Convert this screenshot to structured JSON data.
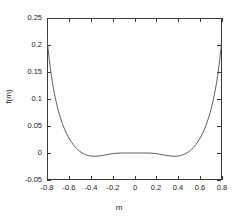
{
  "chart_data": {
    "type": "line",
    "title": "",
    "xlabel": "m",
    "ylabel": "f(m)",
    "xlim": [
      -0.8,
      0.8
    ],
    "ylim": [
      -0.05,
      0.25
    ],
    "grid": false,
    "legend": null,
    "xticks": [
      "-0.8",
      "-0.6",
      "-0.4",
      "-0.2",
      "0",
      "0.2",
      "0.4",
      "0.6",
      "0.8"
    ],
    "xtick_values": [
      -0.8,
      -0.6,
      -0.4,
      -0.2,
      0,
      0.2,
      0.4,
      0.6,
      0.8
    ],
    "yticks": [
      "-0.05",
      "0",
      "0.05",
      "0.1",
      "0.15",
      "0.2",
      "0.25"
    ],
    "ytick_values": [
      -0.05,
      0,
      0.05,
      0.1,
      0.15,
      0.2,
      0.25
    ],
    "series": [
      {
        "name": "f(m)",
        "color": "#4d4d4d",
        "style": "solid",
        "x": [
          -0.8,
          -0.79,
          -0.78,
          -0.77,
          -0.76,
          -0.75,
          -0.74,
          -0.72,
          -0.7,
          -0.68,
          -0.66,
          -0.64,
          -0.62,
          -0.6,
          -0.58,
          -0.56,
          -0.54,
          -0.52,
          -0.5,
          -0.48,
          -0.46,
          -0.44,
          -0.42,
          -0.4,
          -0.36,
          -0.32,
          -0.28,
          -0.24,
          -0.2,
          -0.16,
          -0.12,
          -0.08,
          -0.04,
          0.0,
          0.04,
          0.08,
          0.12,
          0.16,
          0.2,
          0.24,
          0.28,
          0.32,
          0.36,
          0.4,
          0.42,
          0.44,
          0.46,
          0.48,
          0.5,
          0.52,
          0.54,
          0.56,
          0.58,
          0.6,
          0.62,
          0.64,
          0.66,
          0.68,
          0.7,
          0.72,
          0.74,
          0.75,
          0.76,
          0.77,
          0.78,
          0.79,
          0.8
        ],
        "y": [
          0.215,
          0.193,
          0.174,
          0.1575,
          0.143,
          0.13,
          0.1182,
          0.0978,
          0.081,
          0.0668,
          0.0548,
          0.0444,
          0.0355,
          0.0278,
          0.0212,
          0.0155,
          0.0106,
          0.0065,
          0.0031,
          0.0003,
          -0.0019,
          -0.0036,
          -0.0048,
          -0.0056,
          -0.0061,
          -0.0054,
          -0.0041,
          -0.0026,
          -0.0012,
          -0.0003,
          0.0,
          0.0,
          0.0,
          0.0,
          0.0,
          0.0,
          0.0,
          -0.0003,
          -0.0012,
          -0.0026,
          -0.0041,
          -0.0054,
          -0.0061,
          -0.0056,
          -0.0048,
          -0.0036,
          -0.0019,
          0.0003,
          0.0031,
          0.0065,
          0.0106,
          0.0155,
          0.0212,
          0.0278,
          0.0355,
          0.0444,
          0.0548,
          0.0668,
          0.081,
          0.0978,
          0.1182,
          0.13,
          0.143,
          0.1575,
          0.174,
          0.193,
          0.215
        ]
      }
    ],
    "annotations": {
      "local_max": {
        "x": 0.0,
        "y": 0.0
      },
      "minima": [
        {
          "x": -0.46,
          "y": -0.043
        },
        {
          "x": 0.46,
          "y": -0.043
        }
      ]
    }
  },
  "axes": {
    "x_title": "m",
    "y_title": "f(m)"
  }
}
